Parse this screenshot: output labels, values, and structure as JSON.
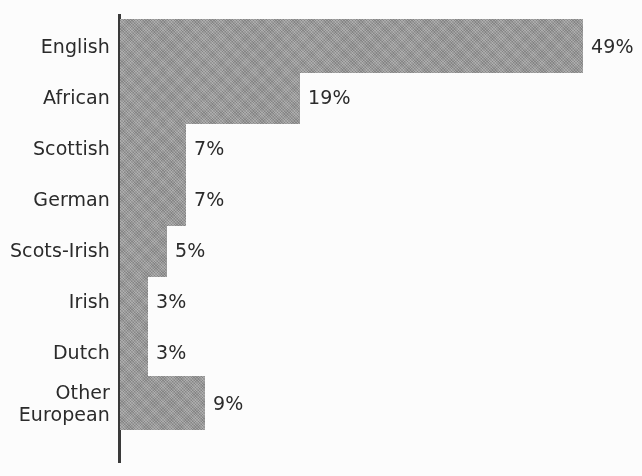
{
  "chart_data": {
    "type": "bar",
    "orientation": "horizontal",
    "title": "",
    "subtitle": "",
    "xlabel": "",
    "ylabel": "",
    "xlim": [
      0,
      52
    ],
    "grid": false,
    "legend": null,
    "value_suffix": "%",
    "categories": [
      "English",
      "African",
      "Scottish",
      "German",
      "Scots-Irish",
      "Irish",
      "Dutch",
      "Other\nEuropean"
    ],
    "values": [
      49,
      19,
      7,
      7,
      5,
      3,
      3,
      9
    ],
    "value_labels": [
      "49%",
      "19%",
      "7%",
      "7%",
      "5%",
      "3%",
      "3%",
      "9%"
    ],
    "series": [
      {
        "name": "Share of ancestry",
        "values": [
          49,
          19,
          7,
          7,
          5,
          3,
          3,
          9
        ]
      }
    ]
  },
  "colors": {
    "bar_fill": "#9a9a9a",
    "axis_line": "#3a3a3a",
    "text": "#2b2b2b",
    "background": "#ffffff"
  },
  "geometry": {
    "axis_x": 118,
    "axis_top": 14,
    "axis_bottom": 463,
    "bar_origin_x": 120,
    "bar_height": 54,
    "bar_pitch": 51,
    "first_bar_top": 19,
    "label_right_x": 110,
    "value_gap": 8,
    "px_per_unit": 9.45
  }
}
